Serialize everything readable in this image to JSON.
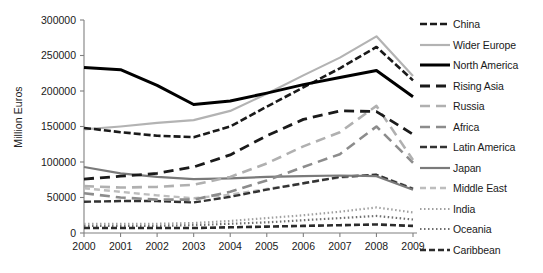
{
  "chart_data": {
    "type": "line",
    "title": "",
    "xlabel": "",
    "ylabel": "Million Euros",
    "x": [
      2000,
      2001,
      2002,
      2003,
      2004,
      2005,
      2006,
      2007,
      2008,
      2009
    ],
    "x_tick_labels": [
      "2000",
      "2001",
      "2002",
      "2003",
      "2004",
      "2005",
      "2006",
      "2007",
      "2008",
      "2009"
    ],
    "ylim": [
      0,
      300000
    ],
    "y_ticks": [
      0,
      50000,
      100000,
      150000,
      200000,
      250000,
      300000
    ],
    "y_tick_labels": [
      "0",
      "50000",
      "100000",
      "150000",
      "200000",
      "250000",
      "300000"
    ],
    "grid": false,
    "legend_position": "right",
    "series": [
      {
        "name": "China",
        "color": "#1a1a1a",
        "width": 2.6,
        "dash": "7,3",
        "values": [
          148000,
          142000,
          137000,
          135000,
          150000,
          178000,
          205000,
          232000,
          262000,
          215000
        ]
      },
      {
        "name": "Wider Europe",
        "color": "#b3b3b3",
        "width": 2.2,
        "dash": "none",
        "values": [
          146000,
          150000,
          155000,
          159000,
          172000,
          196000,
          222000,
          247000,
          277000,
          221000
        ]
      },
      {
        "name": "North America",
        "color": "#000000",
        "width": 3.0,
        "dash": "none",
        "values": [
          233000,
          230000,
          208000,
          181000,
          186000,
          197000,
          209000,
          219000,
          229000,
          192000
        ]
      },
      {
        "name": "Rising Asia",
        "color": "#1a1a1a",
        "width": 2.8,
        "dash": "10,6",
        "values": [
          76000,
          80000,
          84000,
          93000,
          110000,
          137000,
          160000,
          172000,
          171000,
          139000
        ]
      },
      {
        "name": "Russia",
        "color": "#b0b0b0",
        "width": 2.6,
        "dash": "10,6",
        "values": [
          66000,
          64000,
          65000,
          68000,
          79000,
          98000,
          122000,
          142000,
          179000,
          103000
        ]
      },
      {
        "name": "Africa",
        "color": "#8c8c8c",
        "width": 2.6,
        "dash": "10,6",
        "values": [
          56000,
          50000,
          47000,
          47000,
          58000,
          74000,
          93000,
          111000,
          150000,
          99000
        ]
      },
      {
        "name": "Latin America",
        "color": "#333333",
        "width": 2.4,
        "dash": "7,3",
        "values": [
          44000,
          45000,
          45000,
          43000,
          51000,
          61000,
          70000,
          79000,
          82000,
          62000
        ]
      },
      {
        "name": "Japan",
        "color": "#7a7a7a",
        "width": 2.2,
        "dash": "none",
        "values": [
          93000,
          84000,
          79000,
          76000,
          77000,
          79000,
          80000,
          81000,
          80000,
          61000
        ]
      },
      {
        "name": "Middle East",
        "color": "#bdbdbd",
        "width": 2.4,
        "dash": "6,4",
        "values": [
          63000,
          58000,
          53000,
          49000,
          54000,
          62000,
          70000,
          78000,
          82000,
          63000
        ]
      },
      {
        "name": "India",
        "color": "#a0a0a0",
        "width": 2.2,
        "dash": "1.5,2.5",
        "values": [
          13000,
          13000,
          13000,
          14000,
          17000,
          21000,
          25000,
          30000,
          36000,
          29000
        ]
      },
      {
        "name": "Oceania",
        "color": "#6e6e6e",
        "width": 2.2,
        "dash": "1.5,2.5",
        "values": [
          10000,
          10000,
          10000,
          11000,
          13000,
          15000,
          18000,
          21000,
          24000,
          19000
        ]
      },
      {
        "name": "Caribbean",
        "color": "#2b2b2b",
        "width": 2.6,
        "dash": "6,3",
        "values": [
          7000,
          7000,
          7000,
          7000,
          8000,
          9000,
          10000,
          11000,
          12000,
          10000
        ]
      }
    ]
  },
  "legend": {
    "items": [
      {
        "label": "China"
      },
      {
        "label": "Wider Europe"
      },
      {
        "label": "North America"
      },
      {
        "label": "Rising Asia"
      },
      {
        "label": "Russia"
      },
      {
        "label": "Africa"
      },
      {
        "label": "Latin America"
      },
      {
        "label": "Japan"
      },
      {
        "label": "Middle East"
      },
      {
        "label": "India"
      },
      {
        "label": "Oceania"
      },
      {
        "label": "Caribbean"
      }
    ]
  },
  "axis": {
    "y_title": "Million Euros"
  }
}
